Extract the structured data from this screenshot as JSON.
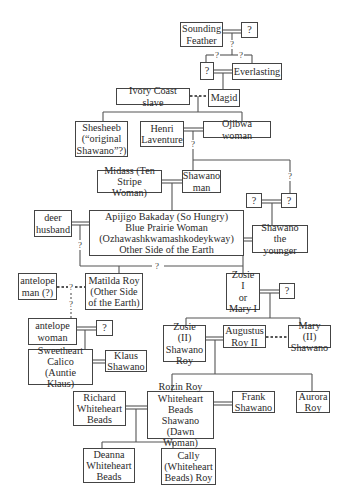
{
  "diagram": {
    "type": "family-tree",
    "nodes": {
      "sounding_feather": "Sounding\nFeather",
      "sf_partner": "?",
      "unknown_parent": "?",
      "everlasting": "Everlasting",
      "ivory_coast_slave": "Ivory Coast slave",
      "magid": "Magid",
      "shesheeb": "Shesheeb\n(“original\nShawano”?)",
      "henri_laventure": "Henri\nLaventure",
      "ojibwa_woman": "Ojibwa woman",
      "midass": "Midass (Ten\nStripe Woman)",
      "shawano_man": "Shawano\nman",
      "unknown_a": "?",
      "unknown_b": "?",
      "deer_husband": "deer\nhusband",
      "apijigo": "Apijigo Bakaday (So Hungry)\nBlue Prairie Woman\n(Ozhawashkwamashkodeykway)\nOther Side of the Earth",
      "shawano_younger": "Shawano the\nyounger",
      "antelope_man": "antelope\nman (?)",
      "matilda_roy": "Matilda Roy\n(Other Side\nof the Earth)",
      "zosie_i": "Zosie I\nor\nMary I",
      "zosie_partner": "?",
      "antelope_woman": "antelope\nwoman",
      "aw_partner": "?",
      "zosie_ii": "Zosie (II)\nShawano\nRoy",
      "augustus_roy": "Augustus\nRoy II",
      "mary_ii": "Mary (II)\nShawano",
      "sweetheart_calico": "Sweetheart\nCalico\n(Auntie Klaus)",
      "klaus_shawano": "Klaus\nShawano",
      "richard": "Richard\nWhiteheart\nBeads",
      "rozin": "Rozin Roy\nWhiteheart\nBeads Shawano\n(Dawn Woman)",
      "frank": "Frank\nShawano",
      "aurora": "Aurora\nRoy",
      "deanna": "Deanna\nWhiteheart\nBeads",
      "cally": "Cally\n(Whiteheart\nBeads) Roy"
    },
    "uncertain_marks": {
      "sf_descent": "?",
      "left_branch": "?",
      "right_branch": "?",
      "henri_descent": "?",
      "right_drop": "?",
      "deer_drop": "?",
      "bottom_line": "?",
      "antelope_union": "?",
      "antelope_descent": "?"
    }
  }
}
